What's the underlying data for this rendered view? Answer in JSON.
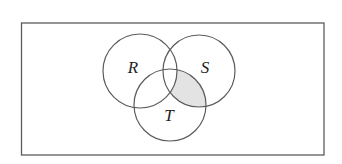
{
  "diagram": {
    "type": "venn",
    "universe": {
      "x": 21.5,
      "y": 23,
      "width": 302.5,
      "height": 132
    },
    "sets": [
      {
        "label": "R",
        "cx": 140,
        "cy": 71,
        "r": 37,
        "label_x": 133,
        "label_y": 72.5
      },
      {
        "label": "S",
        "cx": 199,
        "cy": 71,
        "r": 36,
        "label_x": 205,
        "label_y": 72.5
      },
      {
        "label": "T",
        "cx": 170,
        "cy": 105,
        "r": 36,
        "label_x": 169,
        "label_y": 120.5
      }
    ],
    "shaded_region": "(S ∩ T) − R",
    "colors": {
      "stroke": "#5c5c5c",
      "shade": "#e3e3e3",
      "label": "#1e1e1e",
      "background": "#ffffff"
    }
  }
}
